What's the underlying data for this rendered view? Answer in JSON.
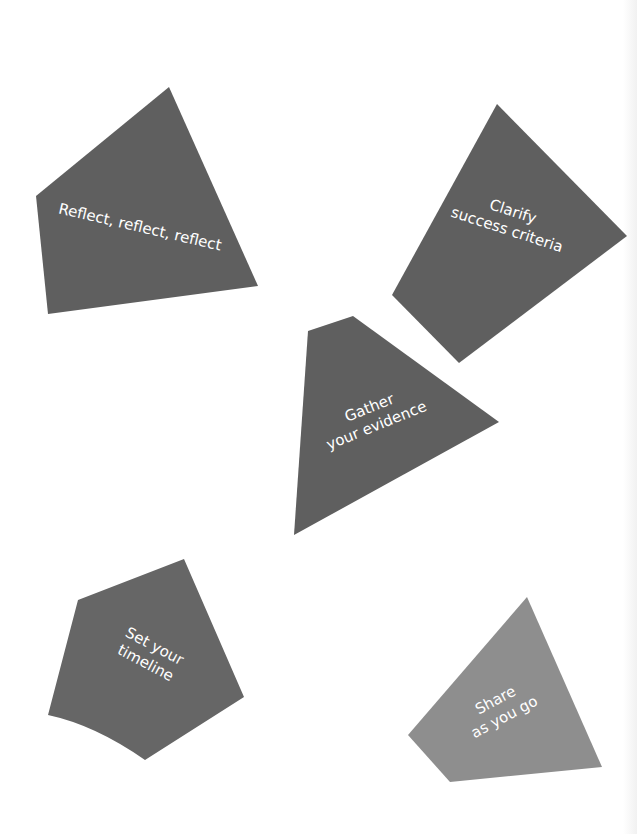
{
  "diagram": {
    "colors": {
      "background": "#ffffff",
      "shape_dark": "#5f5f5f",
      "shape_light": "#8e8e8e",
      "label_text": "#ffffff"
    },
    "shapes": [
      {
        "id": "reflect",
        "lines": [
          "Reflect, reflect, reflect"
        ],
        "points": "36,196 169,87 258,286 48,314"
      },
      {
        "id": "clarify",
        "lines": [
          "Clarify",
          "success criteria"
        ],
        "points": "497,104 627,236 459,363 392,295"
      },
      {
        "id": "gather",
        "lines": [
          "Gather",
          "your evidence"
        ],
        "points": "308,331 353,316 499,422 294,535"
      },
      {
        "id": "timeline",
        "lines": [
          "Set your",
          "timeline"
        ],
        "points": "78,600 184,559 244,697 145,760 60,707 48,715"
      },
      {
        "id": "share",
        "lines": [
          "Share",
          "as you go"
        ],
        "points": "527,597 602,767 450,782 408,735"
      }
    ]
  }
}
